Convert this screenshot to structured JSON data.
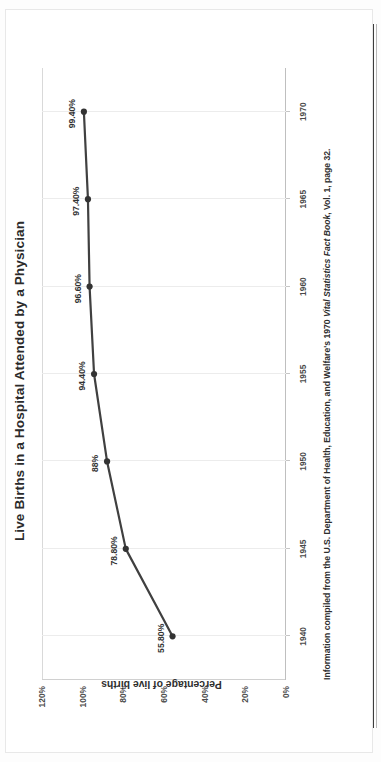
{
  "document": {
    "title": "Live Births in a Hospital Attended by a Physician",
    "footnote_prefix": "Information compiled from the U.S. Department of Health, Education, and Welfare's 1970 ",
    "footnote_italic": "Vital Statistics Fact Book",
    "footnote_suffix": ", Vol. 1, page 32.",
    "orientation": "rotated-90-ccw",
    "colors": {
      "line": "#404040",
      "marker": "#333333",
      "text": "#2b2b2b",
      "grid": "#ececec",
      "axis": "#bfbfbf",
      "background": "#ffffff"
    }
  },
  "chart_data": {
    "type": "line",
    "title": "Live Births in a Hospital Attended by a Physician",
    "xlabel": "",
    "ylabel": "Percentage of live births",
    "x": [
      1940,
      1945,
      1950,
      1955,
      1960,
      1965,
      1970
    ],
    "xtick_labels": [
      "1940",
      "1945",
      "1950",
      "1955",
      "1960",
      "1965",
      "1970"
    ],
    "xlim": [
      1937.5,
      1972.5
    ],
    "values": [
      55.8,
      78.8,
      88.0,
      94.4,
      96.6,
      97.4,
      99.4
    ],
    "point_labels": [
      "55.80%",
      "78.80%",
      "88%",
      "94.40%",
      "96.60%",
      "97.40%",
      "99.40%"
    ],
    "ytick_labels": [
      "120%",
      "100%",
      "80%",
      "60%",
      "40%",
      "20%",
      "0%"
    ],
    "ytick_values": [
      120,
      100,
      80,
      60,
      40,
      20,
      0
    ],
    "ylim": [
      0,
      120
    ],
    "grid": "vertical-only",
    "legend": "none",
    "markers": "circle",
    "series": [
      {
        "name": "Percentage of live births in a hospital attended by a physician",
        "values": [
          55.8,
          78.8,
          88.0,
          94.4,
          96.6,
          97.4,
          99.4
        ]
      }
    ]
  }
}
